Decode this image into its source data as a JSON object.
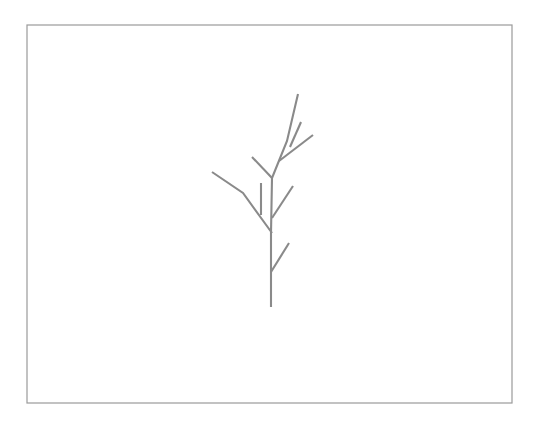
{
  "figure": {
    "canvas": {
      "width": 538,
      "height": 421,
      "background": "#ffffff"
    },
    "frame": {
      "x": 27,
      "y": 25,
      "width": 485,
      "height": 378,
      "stroke": "#9a9a9a",
      "stroke_width": 1.2,
      "fill": "#ffffff"
    },
    "drawing": {
      "stroke": "#8a8a8a",
      "stroke_width": 2.1,
      "type": "polyline-set",
      "strokes": [
        {
          "name": "main-trunk",
          "points": "271,307 271,233 272,178 287,141 298,94"
        },
        {
          "name": "lower-right-twig",
          "points": "271,272 289,243"
        },
        {
          "name": "mid-right-twig",
          "points": "272,218 293,186"
        },
        {
          "name": "short-vertical-twig",
          "points": "261,215 261,183"
        },
        {
          "name": "left-main-branch",
          "points": "272,233 243,193 212,172"
        },
        {
          "name": "upper-left-branch",
          "points": "272,178 252,157"
        },
        {
          "name": "upper-right-branch",
          "points": "279,161 313,135"
        },
        {
          "name": "upper-right-twig",
          "points": "290,147 301,122"
        }
      ]
    }
  }
}
